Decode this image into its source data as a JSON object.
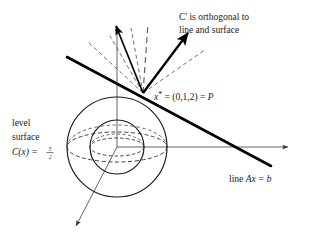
{
  "figure": {
    "title_annotation": {
      "line1": "C' is orthogonal to",
      "line2": "line and surface"
    },
    "point_label": {
      "symbol": "x",
      "star": "*",
      "equals1": " = (0,1,2) = ",
      "point_name": "P",
      "full": "x* = (0,1,2) = P"
    },
    "level_surface_label": {
      "line1": "level",
      "line2": "surface",
      "line3_prefix": "C(x) = ",
      "fraction_numerator": "5",
      "fraction_denominator": "2",
      "full": "level surface C(x) = 5/2"
    },
    "line_label": {
      "prefix": "line ",
      "equation": "Ax = b",
      "full": "line Ax = b"
    },
    "colors": {
      "ink": "#1a1a1a",
      "bold_ink": "#000000",
      "thin_axis": "#3a3a3a",
      "dashed_ray": "#555555",
      "background": "#ffffff"
    },
    "geometry": {
      "sphere_center_x": 117,
      "sphere_center_y": 147,
      "outer_radius": 50,
      "inner_radius": 27,
      "point_P_x": 143,
      "point_P_y": 93,
      "outer_ellipse_rx": 50,
      "outer_ellipse_ry": 15,
      "inner_ellipse_rx": 27,
      "inner_ellipse_ry": 9
    }
  }
}
